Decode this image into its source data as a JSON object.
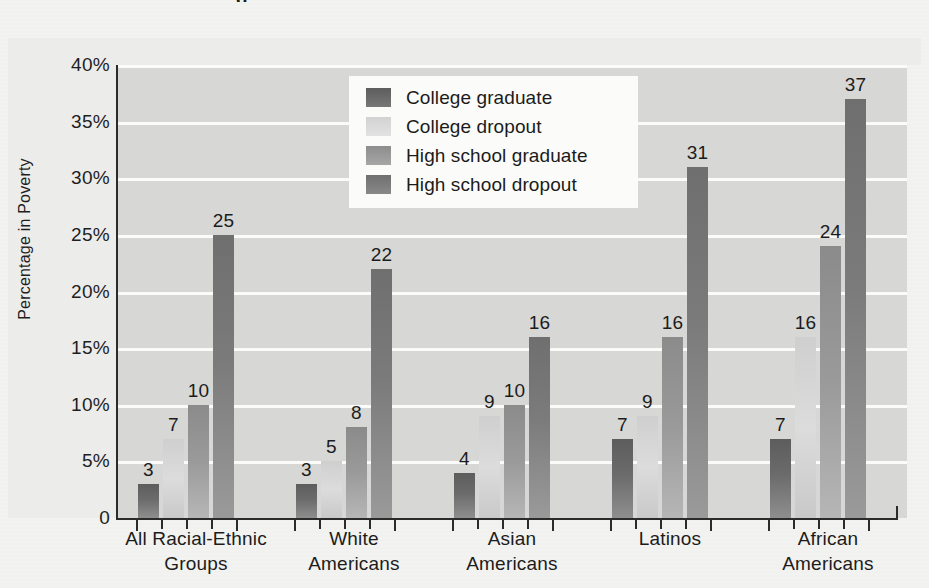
{
  "page": {
    "background_color": "#f3f3f1",
    "title_fragment": "g"
  },
  "chart_data": {
    "type": "bar",
    "title": "",
    "xlabel": "",
    "ylabel": "Percentage in Poverty",
    "ylim": [
      0,
      40
    ],
    "grid": true,
    "legend_position": "top-center",
    "ytick_labels": [
      "40%",
      "35%",
      "30%",
      "25%",
      "20%",
      "15%",
      "10%",
      "5%",
      "0"
    ],
    "ytick_values": [
      40,
      35,
      30,
      25,
      20,
      15,
      10,
      5,
      0
    ],
    "categories": [
      "All Racial-Ethnic\nGroups",
      "White\nAmericans",
      "Asian\nAmericans",
      "Latinos",
      "African\nAmericans"
    ],
    "category_lines": [
      [
        "All Racial-Ethnic",
        "Groups"
      ],
      [
        "White",
        "Americans"
      ],
      [
        "Asian",
        "Americans"
      ],
      [
        "Latinos",
        ""
      ],
      [
        "African",
        "Americans"
      ]
    ],
    "series": [
      {
        "name": "College graduate",
        "color": "#5d5d5d",
        "values": [
          3,
          3,
          4,
          7,
          7
        ]
      },
      {
        "name": "College dropout",
        "color": "#d4d4d4",
        "values": [
          7,
          5,
          9,
          9,
          16
        ]
      },
      {
        "name": "High school graduate",
        "color": "#8f8f8f",
        "values": [
          10,
          8,
          10,
          16,
          24
        ]
      },
      {
        "name": "High school dropout",
        "color": "#6f6f6f",
        "values": [
          25,
          22,
          16,
          31,
          37
        ]
      }
    ],
    "data_labels": [
      [
        3,
        7,
        10,
        25
      ],
      [
        3,
        5,
        8,
        22
      ],
      [
        4,
        9,
        10,
        16
      ],
      [
        7,
        9,
        16,
        31
      ],
      [
        7,
        16,
        24,
        37
      ]
    ],
    "plot_background_color": "#d7d7d5",
    "gridline_color": "#fbfbfa",
    "axis_color": "#2b2b2b"
  },
  "legend": {
    "items": [
      {
        "label": "College graduate"
      },
      {
        "label": "College dropout"
      },
      {
        "label": "High school graduate"
      },
      {
        "label": "High school dropout"
      }
    ]
  }
}
